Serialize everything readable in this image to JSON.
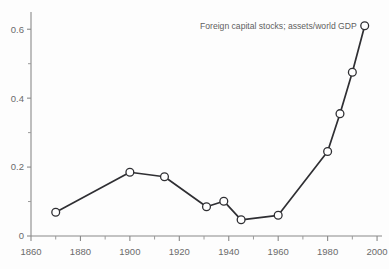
{
  "chart_data": {
    "type": "line",
    "title": "",
    "annotation": "Foreign capital stocks; assets/world GDP",
    "xlabel": "",
    "ylabel": "",
    "xlim": [
      1860,
      2002
    ],
    "ylim": [
      0,
      0.65
    ],
    "grid": false,
    "legend_position": "none",
    "marker": "open-circle",
    "x_ticks": [
      1860,
      1880,
      1900,
      1920,
      1940,
      1960,
      1980,
      2000
    ],
    "x_tick_labels": [
      "1860",
      "1880",
      "1900",
      "1920",
      "1940",
      "1960",
      "1980",
      "2000"
    ],
    "x_minor_ticks": [
      1870,
      1890,
      1910,
      1930,
      1950,
      1970,
      1990
    ],
    "y_ticks": [
      0,
      0.2,
      0.4,
      0.6
    ],
    "y_tick_labels": [
      "0",
      "0.2",
      "0.4",
      "0.6"
    ],
    "y_minor_ticks": [
      0.1,
      0.3,
      0.5
    ],
    "series": [
      {
        "name": "Foreign capital stocks; assets/world GDP",
        "color": "#2f2f33",
        "x": [
          1870,
          1900,
          1914,
          1931,
          1938,
          1945,
          1960,
          1980,
          1985,
          1990,
          1995
        ],
        "y": [
          0.069,
          0.185,
          0.172,
          0.085,
          0.101,
          0.047,
          0.06,
          0.245,
          0.355,
          0.475,
          0.61
        ]
      }
    ]
  },
  "annotations": {
    "series_label": "Foreign capital stocks; assets/world GDP"
  }
}
